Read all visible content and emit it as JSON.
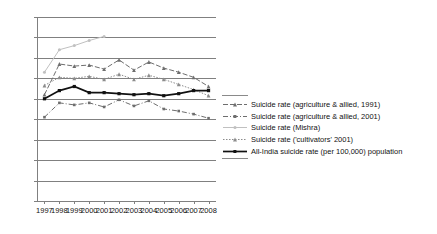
{
  "chart_data": {
    "type": "line",
    "title": "",
    "xlabel": "",
    "ylabel": "",
    "x": [
      1997,
      1998,
      1999,
      2000,
      2001,
      2002,
      2003,
      2004,
      2005,
      2006,
      2007,
      2008
    ],
    "x_tick_labels": [
      "1997",
      "1998",
      "1999",
      "2000",
      "2001",
      "2002",
      "2003",
      "2004",
      "2005",
      "2006",
      "2007",
      "2008"
    ],
    "y_tick_labels": [
      "0.0",
      "2.0",
      "4.0",
      "6.0",
      "8.0",
      "10.0",
      "12.0",
      "14.0",
      "16.0",
      "18.0"
    ],
    "y_ticks": [
      0.0,
      2.0,
      4.0,
      6.0,
      8.0,
      10.0,
      12.0,
      14.0,
      16.0,
      18.0
    ],
    "ylim": [
      0.0,
      18.0
    ],
    "grid": "horizontal",
    "legend_position": "right",
    "series": [
      {
        "name": "Suicide rate (agriculture & allied, 1991)",
        "style": "dashed",
        "marker": "triangle",
        "color": "#6e6e6e",
        "values": [
          10.4,
          13.4,
          13.2,
          13.3,
          12.9,
          13.8,
          12.8,
          13.6,
          13.0,
          12.6,
          12.1,
          11.2
        ]
      },
      {
        "name": "Suicide rate (agriculture & allied, 2001)",
        "style": "dash-dot",
        "marker": "square",
        "color": "#6e6e6e",
        "values": [
          8.2,
          9.6,
          9.4,
          9.6,
          9.2,
          9.9,
          9.3,
          9.8,
          9.0,
          8.8,
          8.5,
          8.1
        ]
      },
      {
        "name": "Suicide rate (Mishra)",
        "style": "solid-light",
        "marker": "circle",
        "color": "#c0c0c0",
        "values": [
          12.6,
          14.8,
          15.2,
          15.7,
          16.1,
          null,
          null,
          null,
          null,
          null,
          null,
          null
        ]
      },
      {
        "name": "Suicide rate ('cultivators' 2001)",
        "style": "dotted",
        "marker": "triangle",
        "color": "#8c8c8c",
        "values": [
          11.3,
          12.1,
          12.0,
          12.2,
          11.9,
          12.4,
          11.9,
          12.3,
          11.9,
          11.4,
          10.9,
          10.3
        ]
      },
      {
        "name": "All-India suicide rate (per 100,000) population",
        "style": "solid-bold",
        "marker": "square",
        "color": "#111111",
        "values": [
          10.0,
          10.8,
          11.2,
          10.6,
          10.6,
          10.5,
          10.4,
          10.5,
          10.3,
          10.5,
          10.8,
          10.8
        ]
      }
    ]
  },
  "legend": {
    "items": [
      {
        "label": "Suicide rate (agriculture & allied, 1991)"
      },
      {
        "label": "Suicide rate (agriculture & allied, 2001)"
      },
      {
        "label": "Suicide rate (Mishra)"
      },
      {
        "label": "Suicide rate ('cultivators' 2001)"
      },
      {
        "label": "All-India suicide rate (per 100,000) population"
      }
    ]
  }
}
